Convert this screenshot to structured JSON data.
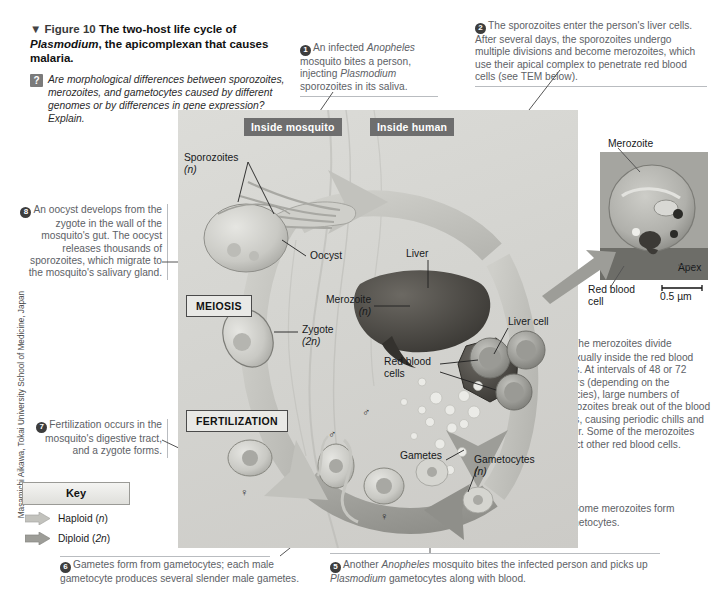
{
  "figure": {
    "marker": "▼",
    "number_label": "Figure 10",
    "title_part1": "The two-host life cycle of ",
    "title_species": "Plasmodium",
    "title_part2": ", the apicomplexan that causes malaria.",
    "question_badge": "?",
    "question_text": "Are morphological differences between sporozoites, merozoites, and gametocytes caused by different genomes or by differences in gene expression? Explain.",
    "credit": "Masamichi Aikawa, Tokai University School of Medicine, Japan"
  },
  "callouts": {
    "one": {
      "num": "1",
      "lines": [
        "An infected ",
        "Anopheles",
        " mosquito bites a person, injecting ",
        "Plasmodium",
        " sporozoites in its saliva."
      ],
      "text": "An infected Anopheles mosquito bites a person, injecting Plasmodium sporozoites in its saliva."
    },
    "two": {
      "num": "2",
      "text": "The sporozoites enter the person's liver cells. After several days, the sporozoites undergo multiple divisions and become merozoites, which use their apical complex to penetrate red blood cells (see TEM below)."
    },
    "three": {
      "num": "3",
      "text": "The merozoites divide asexually inside the red blood cells. At intervals of 48 or 72 hours (depending on the species), large numbers of merozoites break out of the blood cells, causing periodic chills and fever. Some of the merozoites infect other red blood cells."
    },
    "four": {
      "num": "4",
      "text": "Some merozoites form gametocytes."
    },
    "five": {
      "num": "5",
      "text": "Another Anopheles mosquito bites the infected person and picks up Plasmodium gametocytes along with blood.",
      "species1": "Anopheles",
      "species2": "Plasmodium"
    },
    "six": {
      "num": "6",
      "text": "Gametes form from gametocytes; each male gametocyte produces several slender male gametes."
    },
    "seven": {
      "num": "7",
      "text": "Fertilization occurs in the mosquito's digestive tract, and a zygote forms."
    },
    "eight": {
      "num": "8",
      "text": "An oocyst develops from the zygote in the wall of the mosquito's gut. The oocyst releases thousands of sporozoites, which migrate to the mosquito's salivary gland."
    }
  },
  "diagram": {
    "stage_mosquito": "Inside mosquito",
    "stage_human": "Inside human",
    "process_meiosis": "MEIOSIS",
    "process_fertilization": "FERTILIZATION",
    "labels": {
      "sporozoites": "Sporozoites",
      "sporozoites_ploidy": "(n)",
      "oocyst": "Oocyst",
      "zygote": "Zygote",
      "zygote_ploidy": "(2n)",
      "liver": "Liver",
      "liver_cell": "Liver cell",
      "merozoite": "Merozoite",
      "merozoite_ploidy": "(n)",
      "red_blood_cells_l1": "Red blood",
      "red_blood_cells_l2": "cells",
      "gametes": "Gametes",
      "gametocytes": "Gametocytes",
      "gametocytes_ploidy": "(n)",
      "male_symbol": "♂",
      "female_symbol": "♀"
    }
  },
  "tem": {
    "label_merozoite": "Merozoite",
    "label_apex": "Apex",
    "label_rbc_l1": "Red blood",
    "label_rbc_l2": "cell",
    "scale_bar": "0.5 µm"
  },
  "key": {
    "title": "Key",
    "items": [
      {
        "label": "Haploid (",
        "ploidy": "n",
        "suffix": ")",
        "full": "Haploid (n)",
        "color": "#bfbfbb"
      },
      {
        "label": "Diploid (",
        "ploidy": "2n",
        "suffix": ")",
        "full": "Diploid (2n)",
        "color": "#a3a39e"
      }
    ]
  },
  "colors": {
    "panel_bg": "#d6d6d2",
    "tag_bg": "#6e6e6e",
    "callout_text": "#5d6166",
    "arrow_haploid": "#c2c2bd",
    "arrow_diploid": "#9d9d98"
  }
}
